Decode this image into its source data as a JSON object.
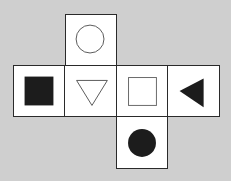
{
  "diagram": {
    "type": "cube-net",
    "background": "#cfcfcf",
    "faces": [
      {
        "id": "top",
        "position": "row0-col1",
        "symbol": "circle-outline"
      },
      {
        "id": "left",
        "position": "row1-col0",
        "symbol": "square-filled"
      },
      {
        "id": "center",
        "position": "row1-col1",
        "symbol": "triangle-down-outline"
      },
      {
        "id": "right-1",
        "position": "row1-col2",
        "symbol": "square-outline"
      },
      {
        "id": "right-2",
        "position": "row1-col3",
        "symbol": "triangle-left-filled"
      },
      {
        "id": "bottom",
        "position": "row2-col2",
        "symbol": "circle-filled"
      }
    ]
  }
}
